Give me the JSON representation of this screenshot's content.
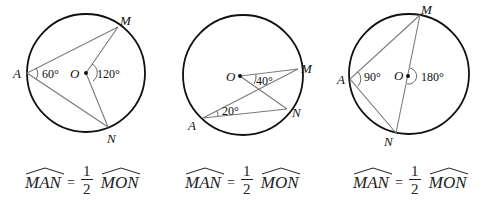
{
  "diagrams": [
    {
      "labels": {
        "A": "A",
        "M": "M",
        "N": "N",
        "O": "O"
      },
      "inscribed_angle": "60°",
      "central_angle": "120°"
    },
    {
      "labels": {
        "A": "A",
        "M": "M",
        "N": "N",
        "O": "O"
      },
      "inscribed_angle": "20°",
      "central_angle": "40°"
    },
    {
      "labels": {
        "A": "A",
        "M": "M",
        "N": "N",
        "O": "O"
      },
      "inscribed_angle": "90°",
      "central_angle": "180°"
    }
  ],
  "formulas": [
    {
      "lhs": "MAN",
      "eq": "=",
      "num": "1",
      "den": "2",
      "rhs": "MON"
    },
    {
      "lhs": "MAN",
      "eq": "=",
      "num": "1",
      "den": "2",
      "rhs": "MON"
    },
    {
      "lhs": "MAN",
      "eq": "=",
      "num": "1",
      "den": "2",
      "rhs": "MON"
    }
  ],
  "colors": {
    "circle": "#111111",
    "chord": "#7a7a7a",
    "text": "#222222"
  }
}
